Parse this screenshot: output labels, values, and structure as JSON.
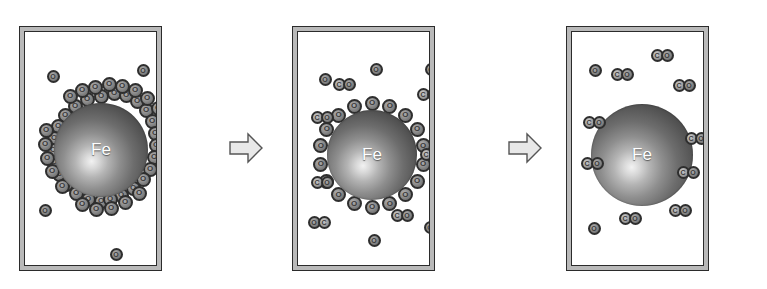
{
  "figure": {
    "panel_count": 3,
    "arrow_count": 2,
    "colors": {
      "frame_border": "#2b2b2b",
      "frame_band": "#b9b9b9",
      "panel_background": "#ffffff",
      "particle_core_dark": "#3a3a3a",
      "particle_highlight": "#f2f2f2",
      "atom_fill": "#a8a8a8",
      "atom_outline": "#2e2e2e",
      "arrow_fill": "#e8e8e8",
      "arrow_outline": "#555555",
      "label_text": "#ffffff"
    }
  },
  "labels": {
    "iron": "Fe",
    "oxygen": "O",
    "carbon": "C"
  },
  "arrows": [
    {
      "name": "arrow-stage-1-to-2",
      "direction": "right",
      "x": 229,
      "y": 132,
      "w": 34,
      "h": 32
    },
    {
      "name": "arrow-stage-2-to-3",
      "direction": "right",
      "x": 508,
      "y": 132,
      "w": 34,
      "h": 32
    }
  ],
  "panels": [
    {
      "id": "panel-1",
      "stage": 1,
      "caption": "Fe particle fully covered by a dense multilayer of adsorbed oxygen atoms",
      "x": 19,
      "y": 26,
      "w": 143,
      "h": 245,
      "particle": {
        "cx": 76,
        "cy": 118,
        "r": 47
      },
      "shell": {
        "type": "dense-cluster",
        "species": "O",
        "count": 46,
        "atom_size": 15
      },
      "shell_atoms": [
        {
          "cx": 76,
          "cy": 64,
          "r": 8
        },
        {
          "cx": 89,
          "cy": 61,
          "r": 8
        },
        {
          "cx": 62,
          "cy": 67,
          "r": 8
        },
        {
          "cx": 101,
          "cy": 63,
          "r": 8
        },
        {
          "cx": 50,
          "cy": 74,
          "r": 8
        },
        {
          "cx": 112,
          "cy": 69,
          "r": 8
        },
        {
          "cx": 40,
          "cy": 83,
          "r": 8
        },
        {
          "cx": 121,
          "cy": 78,
          "r": 8
        },
        {
          "cx": 33,
          "cy": 94,
          "r": 8
        },
        {
          "cx": 127,
          "cy": 89,
          "r": 8
        },
        {
          "cx": 29,
          "cy": 106,
          "r": 8
        },
        {
          "cx": 130,
          "cy": 101,
          "r": 8
        },
        {
          "cx": 28,
          "cy": 118,
          "r": 8
        },
        {
          "cx": 131,
          "cy": 113,
          "r": 8
        },
        {
          "cx": 29,
          "cy": 130,
          "r": 8
        },
        {
          "cx": 129,
          "cy": 125,
          "r": 8
        },
        {
          "cx": 34,
          "cy": 142,
          "r": 8
        },
        {
          "cx": 125,
          "cy": 137,
          "r": 8
        },
        {
          "cx": 41,
          "cy": 152,
          "r": 8
        },
        {
          "cx": 118,
          "cy": 147,
          "r": 8
        },
        {
          "cx": 51,
          "cy": 161,
          "r": 8
        },
        {
          "cx": 108,
          "cy": 156,
          "r": 8
        },
        {
          "cx": 63,
          "cy": 167,
          "r": 8
        },
        {
          "cx": 96,
          "cy": 163,
          "r": 8
        },
        {
          "cx": 76,
          "cy": 169,
          "r": 8
        },
        {
          "cx": 85,
          "cy": 167,
          "r": 8
        },
        {
          "cx": 70,
          "cy": 55,
          "r": 8
        },
        {
          "cx": 84,
          "cy": 52,
          "r": 8
        },
        {
          "cx": 97,
          "cy": 54,
          "r": 8
        },
        {
          "cx": 110,
          "cy": 58,
          "r": 8
        },
        {
          "cx": 122,
          "cy": 66,
          "r": 8
        },
        {
          "cx": 133,
          "cy": 76,
          "r": 8
        },
        {
          "cx": 141,
          "cy": 92,
          "r": 8
        },
        {
          "cx": 140,
          "cy": 110,
          "r": 8
        },
        {
          "cx": 57,
          "cy": 58,
          "r": 8
        },
        {
          "cx": 45,
          "cy": 64,
          "r": 8
        },
        {
          "cx": 21,
          "cy": 98,
          "r": 8
        },
        {
          "cx": 20,
          "cy": 112,
          "r": 8
        },
        {
          "cx": 22,
          "cy": 126,
          "r": 8
        },
        {
          "cx": 27,
          "cy": 139,
          "r": 8
        },
        {
          "cx": 37,
          "cy": 154,
          "r": 8
        },
        {
          "cx": 57,
          "cy": 172,
          "r": 8
        },
        {
          "cx": 71,
          "cy": 177,
          "r": 8
        },
        {
          "cx": 86,
          "cy": 176,
          "r": 8
        },
        {
          "cx": 100,
          "cy": 170,
          "r": 8
        },
        {
          "cx": 114,
          "cy": 161,
          "r": 8
        }
      ],
      "free_species": [
        {
          "type": "O",
          "cx": 28,
          "cy": 44,
          "name": "oxygen-atom"
        },
        {
          "type": "O",
          "cx": 118,
          "cy": 38,
          "name": "oxygen-atom"
        },
        {
          "type": "O",
          "cx": 20,
          "cy": 178,
          "name": "oxygen-atom"
        },
        {
          "type": "O",
          "cx": 91,
          "cy": 222,
          "name": "oxygen-atom"
        }
      ]
    },
    {
      "id": "panel-2",
      "stage": 2,
      "caption": "Partially stripped particle with a single ordered oxygen monolayer; CO molecules released into the gas phase",
      "x": 292,
      "y": 26,
      "w": 143,
      "h": 245,
      "particle": {
        "cx": 74,
        "cy": 123,
        "r": 45
      },
      "shell": {
        "type": "single-ring",
        "species": "O",
        "count": 18,
        "ring_radius": 52,
        "atom_size": 15
      },
      "free_species": [
        {
          "type": "O",
          "cx": 27,
          "cy": 47,
          "name": "oxygen-atom"
        },
        {
          "type": "O",
          "cx": 78,
          "cy": 37,
          "name": "oxygen-atom"
        },
        {
          "type": "O",
          "cx": 133,
          "cy": 37,
          "name": "oxygen-atom"
        },
        {
          "type": "CO",
          "cx": 46,
          "cy": 52,
          "order": "C-O",
          "name": "carbon-monoxide-molecule"
        },
        {
          "type": "CO",
          "cx": 24,
          "cy": 85,
          "order": "C-O",
          "name": "carbon-monoxide-molecule"
        },
        {
          "type": "CO",
          "cx": 24,
          "cy": 150,
          "order": "C-O",
          "name": "carbon-monoxide-molecule"
        },
        {
          "type": "CO",
          "cx": 21,
          "cy": 190,
          "order": "O-C",
          "name": "carbon-monoxide-molecule"
        },
        {
          "type": "CO",
          "cx": 130,
          "cy": 62,
          "order": "C-O",
          "name": "carbon-monoxide-molecule"
        },
        {
          "type": "CO",
          "cx": 133,
          "cy": 122,
          "order": "C-O",
          "name": "carbon-monoxide-molecule"
        },
        {
          "type": "CO",
          "cx": 104,
          "cy": 183,
          "order": "C-O",
          "name": "carbon-monoxide-molecule"
        },
        {
          "type": "O",
          "cx": 76,
          "cy": 208,
          "name": "oxygen-atom"
        },
        {
          "type": "O",
          "cx": 132,
          "cy": 195,
          "name": "oxygen-atom"
        }
      ]
    },
    {
      "id": "panel-3",
      "stage": 3,
      "caption": "Clean Fe particle; all surface oxygen has desorbed as CO",
      "x": 566,
      "y": 26,
      "w": 143,
      "h": 245,
      "particle": {
        "cx": 70,
        "cy": 123,
        "r": 51
      },
      "shell": {
        "type": "none",
        "species": null,
        "count": 0
      },
      "free_species": [
        {
          "type": "CO",
          "cx": 90,
          "cy": 23,
          "order": "C-O",
          "name": "carbon-monoxide-molecule"
        },
        {
          "type": "O",
          "cx": 23,
          "cy": 38,
          "name": "oxygen-atom"
        },
        {
          "type": "CO",
          "cx": 50,
          "cy": 42,
          "order": "C-O",
          "name": "carbon-monoxide-molecule"
        },
        {
          "type": "CO",
          "cx": 112,
          "cy": 53,
          "order": "C-O",
          "name": "carbon-monoxide-molecule"
        },
        {
          "type": "CO",
          "cx": 22,
          "cy": 90,
          "order": "C-O",
          "name": "carbon-monoxide-molecule"
        },
        {
          "type": "CO",
          "cx": 20,
          "cy": 131,
          "order": "C-O",
          "name": "carbon-monoxide-molecule"
        },
        {
          "type": "CO",
          "cx": 124,
          "cy": 106,
          "order": "C-O",
          "name": "carbon-monoxide-molecule"
        },
        {
          "type": "CO",
          "cx": 116,
          "cy": 140,
          "order": "C-O",
          "name": "carbon-monoxide-molecule"
        },
        {
          "type": "CO",
          "cx": 108,
          "cy": 178,
          "order": "C-O",
          "name": "carbon-monoxide-molecule"
        },
        {
          "type": "CO",
          "cx": 58,
          "cy": 186,
          "order": "C-O",
          "name": "carbon-monoxide-molecule"
        },
        {
          "type": "O",
          "cx": 22,
          "cy": 196,
          "name": "oxygen-atom"
        }
      ]
    }
  ]
}
